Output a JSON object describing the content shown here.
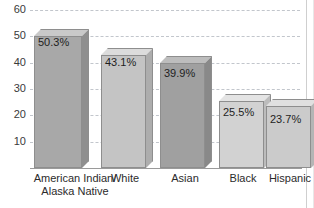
{
  "chart_data": {
    "type": "bar",
    "title": "",
    "xlabel": "",
    "ylabel": "",
    "categories": [
      "American Indian/\nAlaska Native",
      "White",
      "Asian",
      "Black",
      "Hispanic"
    ],
    "values": [
      50.3,
      43.1,
      39.9,
      25.5,
      23.7
    ],
    "value_labels": [
      "50.3%",
      "43.1%",
      "39.9%",
      "25.5%",
      "23.7%"
    ],
    "ylim": [
      0,
      60
    ],
    "yticks": [
      10,
      20,
      30,
      40,
      50,
      60
    ],
    "ytick_labels": [
      "10",
      "20",
      "30",
      "40",
      "50",
      "60"
    ],
    "grid": true,
    "grid_style": "dashed",
    "legend": "none",
    "bar_colors": [
      "#a8a8a8",
      "#c4c4c4",
      "#a0a0a0",
      "#d2d2d2",
      "#cbcbcb"
    ],
    "bar_top_colors": [
      "#c9c9c9",
      "#dcdcdc",
      "#bdbdbd",
      "#e4e4e4",
      "#e0e0e0"
    ],
    "bar_side_colors": [
      "#8f8f8f",
      "#adadad",
      "#898989",
      "#bcbcbc",
      "#b5b5b5"
    ]
  },
  "axis": {
    "ytick_labels": [
      "60",
      "50",
      "40",
      "30",
      "20",
      "10"
    ]
  }
}
